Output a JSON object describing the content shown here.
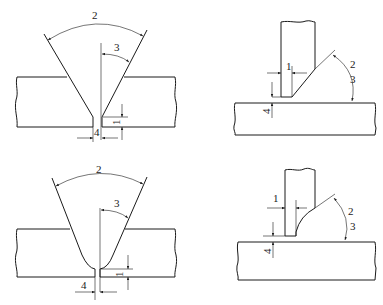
{
  "figure": {
    "stroke_color": "#1a1a1a",
    "background": "#ffffff"
  },
  "panels": [
    {
      "id": "top-left",
      "type": "V-groove butt joint (sharp root)",
      "labels": {
        "groove_angle": "2",
        "bevel_angle": "3",
        "root_face": "1",
        "root_gap": "4"
      }
    },
    {
      "id": "top-right",
      "type": "Single-bevel T-joint (straight bevel)",
      "labels": {
        "gap": "1",
        "angle_a": "2",
        "angle_b": "3",
        "root_face": "4"
      }
    },
    {
      "id": "bottom-left",
      "type": "U/V-groove butt joint (radiused root)",
      "labels": {
        "groove_angle": "2",
        "bevel_angle": "3",
        "root_face": "1",
        "root_gap": "4"
      }
    },
    {
      "id": "bottom-right",
      "type": "Single-bevel T-joint (curved bevel)",
      "labels": {
        "gap": "1",
        "angle_a": "2",
        "angle_b": "3",
        "root_face": "4"
      }
    }
  ]
}
